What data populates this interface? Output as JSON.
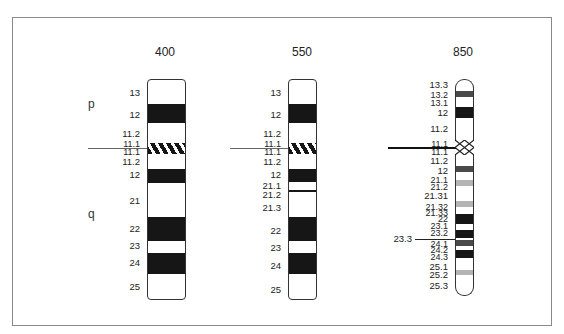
{
  "figure": {
    "arm_labels": {
      "p": "p",
      "q": "q"
    },
    "chromosomes": [
      {
        "resolution": "400",
        "labels": [
          "13",
          "12",
          "11.2",
          "11.1",
          "11.1",
          "11.2",
          "12",
          "21",
          "22",
          "23",
          "24",
          "25"
        ],
        "bands": [
          {
            "name": "p13",
            "shade": "white"
          },
          {
            "name": "p12",
            "shade": "black"
          },
          {
            "name": "p11.2",
            "shade": "white"
          },
          {
            "name": "p11.1-q11.1",
            "shade": "hatched"
          },
          {
            "name": "q11.2",
            "shade": "white"
          },
          {
            "name": "q12",
            "shade": "black"
          },
          {
            "name": "q21",
            "shade": "white"
          },
          {
            "name": "q22",
            "shade": "black"
          },
          {
            "name": "q23",
            "shade": "white"
          },
          {
            "name": "q24",
            "shade": "black"
          },
          {
            "name": "q25",
            "shade": "white"
          }
        ]
      },
      {
        "resolution": "550",
        "labels": [
          "13",
          "12",
          "11.2",
          "11.1",
          "11.1",
          "11.2",
          "12",
          "21.1",
          "21.2",
          "21.3",
          "22",
          "23",
          "24",
          "25"
        ],
        "bands": [
          {
            "name": "p13",
            "shade": "white"
          },
          {
            "name": "p12",
            "shade": "black"
          },
          {
            "name": "p11.2",
            "shade": "white"
          },
          {
            "name": "p11.1-q11.1",
            "shade": "hatched"
          },
          {
            "name": "q11.2",
            "shade": "white"
          },
          {
            "name": "q12",
            "shade": "black"
          },
          {
            "name": "q21.1",
            "shade": "white"
          },
          {
            "name": "q21.2",
            "shade": "black-thin"
          },
          {
            "name": "q21.3",
            "shade": "white"
          },
          {
            "name": "q22",
            "shade": "black"
          },
          {
            "name": "q23",
            "shade": "white"
          },
          {
            "name": "q24",
            "shade": "black"
          },
          {
            "name": "q25",
            "shade": "white"
          }
        ]
      },
      {
        "resolution": "850",
        "labels": [
          "13.3",
          "13.2",
          "13.1",
          "12",
          "11.2",
          "11.1",
          "11.1",
          "11.2",
          "12",
          "21.1",
          "21.2",
          "21.31",
          "21.32",
          "21.33",
          "22",
          "23.1",
          "23.2",
          "24.1",
          "24.2",
          "24.3",
          "25.1",
          "25.2",
          "25.3"
        ],
        "marker_label": "23.3",
        "bands": [
          {
            "name": "p13.3",
            "shade": "white"
          },
          {
            "name": "p13.2",
            "shade": "dark-gray"
          },
          {
            "name": "p13.1",
            "shade": "white"
          },
          {
            "name": "p12",
            "shade": "black"
          },
          {
            "name": "p11.2",
            "shade": "white"
          },
          {
            "name": "p11.1-q11.1",
            "shade": "crosshatch"
          },
          {
            "name": "q11.2",
            "shade": "white"
          },
          {
            "name": "q12",
            "shade": "dark-gray"
          },
          {
            "name": "q21.1",
            "shade": "white"
          },
          {
            "name": "q21.2",
            "shade": "light-gray"
          },
          {
            "name": "q21.31",
            "shade": "white"
          },
          {
            "name": "q21.32",
            "shade": "light-gray"
          },
          {
            "name": "q21.33",
            "shade": "white"
          },
          {
            "name": "q22",
            "shade": "black"
          },
          {
            "name": "q23.1",
            "shade": "white"
          },
          {
            "name": "q23.2",
            "shade": "black"
          },
          {
            "name": "q23.3",
            "shade": "white"
          },
          {
            "name": "q24.1",
            "shade": "dark-gray"
          },
          {
            "name": "q24.2",
            "shade": "white"
          },
          {
            "name": "q24.3",
            "shade": "black"
          },
          {
            "name": "q25.1",
            "shade": "white"
          },
          {
            "name": "q25.2",
            "shade": "light-gray"
          },
          {
            "name": "q25.3",
            "shade": "white"
          }
        ]
      }
    ],
    "colors": {
      "black": "#161616",
      "dark_gray": "#4a4a4a",
      "light_gray": "#b4b4b4",
      "frame": "#8a8a8a"
    }
  }
}
